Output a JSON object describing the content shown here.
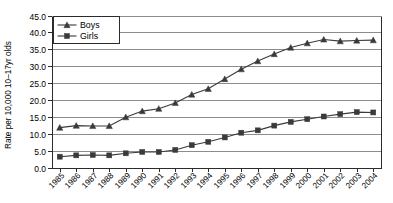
{
  "chart_data": {
    "type": "line",
    "title": "",
    "xlabel": "",
    "ylabel": "Rate per 10,000 10–17yr olds",
    "ylim": [
      0.0,
      45.0
    ],
    "ytick_values": [
      0.0,
      5.0,
      10.0,
      15.0,
      20.0,
      25.0,
      30.0,
      35.0,
      40.0,
      45.0
    ],
    "ytick_labels": [
      "0.0",
      "5.0",
      "10.0",
      "15.0",
      "20.0",
      "25.0",
      "30.0",
      "35.0",
      "40.0",
      "45.0"
    ],
    "grid": "horizontal",
    "legend_position": "upper-left-inside",
    "categories": [
      1985,
      1986,
      1987,
      1988,
      1989,
      1990,
      1991,
      1992,
      1993,
      1994,
      1995,
      1996,
      1997,
      1998,
      1999,
      2000,
      2001,
      2002,
      2003,
      2004
    ],
    "xtick_labels": [
      "1985",
      "1986",
      "1987",
      "1988",
      "1989",
      "1990",
      "1991",
      "1992",
      "1993",
      "1994",
      "1995",
      "1996",
      "1997",
      "1998",
      "1999",
      "2000",
      "2001",
      "2002",
      "2003",
      "2004"
    ],
    "series": [
      {
        "name": "Boys",
        "marker": "triangle",
        "color": "#3a3a3a",
        "values": [
          11.8,
          12.4,
          12.3,
          12.3,
          14.9,
          16.7,
          17.4,
          19.1,
          21.6,
          23.3,
          26.2,
          29.1,
          31.5,
          33.6,
          35.5,
          36.8,
          37.9,
          37.4,
          37.6,
          37.7
        ]
      },
      {
        "name": "Girls",
        "marker": "square",
        "color": "#3a3a3a",
        "values": [
          3.2,
          3.6,
          3.7,
          3.6,
          4.2,
          4.6,
          4.6,
          5.2,
          6.6,
          7.6,
          8.9,
          10.3,
          11.0,
          12.4,
          13.5,
          14.3,
          15.1,
          15.8,
          16.4,
          16.3
        ]
      }
    ]
  },
  "legend": {
    "entries": [
      {
        "label": "Boys"
      },
      {
        "label": "Girls"
      }
    ]
  },
  "axis": {
    "y_title": "Rate per 10,000 10–17yr olds"
  }
}
